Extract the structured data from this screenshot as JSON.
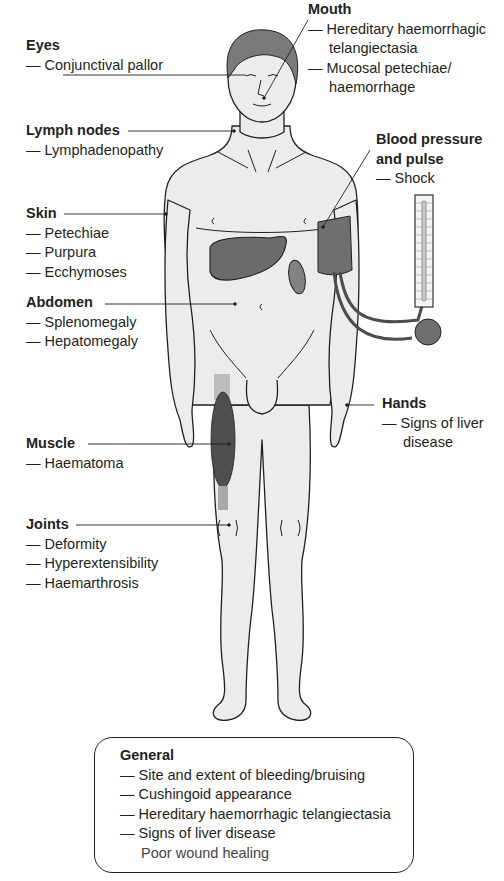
{
  "figure": {
    "colors": {
      "skin": "#ececec",
      "outline": "#231f20",
      "hair": "#7a7a7a",
      "organ": "#6b6b6b",
      "cuff": "#6f6f6f",
      "muscle": "#4f4f4f",
      "text": "#231f20"
    }
  },
  "labels": {
    "eyes": {
      "title": "Eyes",
      "items": [
        "— Conjunctival pallor"
      ]
    },
    "lymph": {
      "title": "Lymph nodes",
      "items": [
        "— Lymphadenopathy"
      ]
    },
    "skin": {
      "title": "Skin",
      "items": [
        "— Petechiae",
        "— Purpura",
        "— Ecchymoses"
      ]
    },
    "abdomen": {
      "title": "Abdomen",
      "items": [
        "— Splenomegaly",
        "— Hepatomegaly"
      ]
    },
    "muscle": {
      "title": "Muscle",
      "items": [
        "— Haematoma"
      ]
    },
    "joints": {
      "title": "Joints",
      "items": [
        "— Deformity",
        "— Hyperextensibility",
        "— Haemarthrosis"
      ]
    },
    "mouth": {
      "title": "Mouth",
      "items": [
        "— Hereditary haemorrhagic",
        "telangiectasia",
        "— Mucosal petechiae/",
        "haemorrhage"
      ]
    },
    "bp": {
      "title_line1": "Blood pressure",
      "title_line2": "and pulse",
      "items": [
        "— Shock"
      ]
    },
    "hands": {
      "title": "Hands",
      "items": [
        "— Signs of liver",
        "disease"
      ]
    }
  },
  "general": {
    "title": "General",
    "items": [
      "— Site and extent of bleeding/bruising",
      "— Cushingoid appearance",
      "— Hereditary haemorrhagic telangiectasia",
      "— Signs of liver disease",
      "Poor wound healing"
    ]
  }
}
